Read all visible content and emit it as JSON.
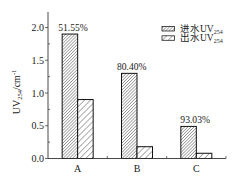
{
  "chart_data": {
    "type": "bar",
    "title": "",
    "xlabel": "",
    "ylabel": "UV254/cm-1",
    "ylabel_parts": {
      "main": "UV",
      "sub": "254",
      "unit": "/cm",
      "sup": "-1"
    },
    "categories": [
      "A",
      "B",
      "C"
    ],
    "series": [
      {
        "key": "inflow",
        "name": "进水UV254",
        "label": "进水UV",
        "sub": "254",
        "pattern": "dense-diagonal-hatch",
        "values": [
          1.9,
          1.3,
          0.49
        ]
      },
      {
        "key": "outflow",
        "name": "出水UV254",
        "label": "出水UV",
        "sub": "254",
        "pattern": "sparse-diagonal-hatch",
        "values": [
          0.9,
          0.18,
          0.08
        ]
      }
    ],
    "annotations": [
      "51.55%",
      "80.40%",
      "93.03%"
    ],
    "yticks": [
      "0.0",
      "0.5",
      "1.0",
      "1.5",
      "2.0"
    ],
    "ylim": [
      0,
      2.2
    ],
    "grid": false,
    "legend_position": "upper right"
  }
}
